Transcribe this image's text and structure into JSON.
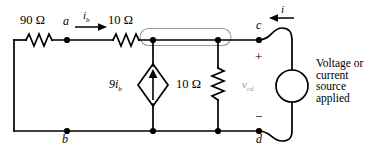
{
  "diagram": {
    "colors": {
      "wire": "#000000",
      "supernode_outline": "#9a9a9a",
      "vcd_label": "#9a9a9a",
      "background": "#ffffff"
    },
    "components": {
      "r90": {
        "label": "90 Ω",
        "orientation": "horizontal"
      },
      "r10_series": {
        "label": "10 Ω",
        "orientation": "horizontal"
      },
      "r10_shunt": {
        "label": "10 Ω",
        "orientation": "vertical"
      },
      "dependent_source": {
        "label_main": "9i",
        "label_sub": "b",
        "type": "current",
        "arrow": "up"
      },
      "applied_source": {
        "type": "generic",
        "shape": "circle"
      }
    },
    "nodes": [
      {
        "id": "a",
        "label": "a"
      },
      {
        "id": "b",
        "label": "b"
      },
      {
        "id": "c",
        "label": "c"
      },
      {
        "id": "d",
        "label": "d"
      }
    ],
    "currents": {
      "ib": {
        "label_main": "i",
        "label_sub": "b",
        "direction": "right"
      },
      "i": {
        "label_main": "i",
        "direction": "left"
      }
    },
    "voltage": {
      "vcd": {
        "label_main": "v",
        "label_sub": "cd"
      },
      "plus": "+",
      "minus": "−"
    },
    "source_caption": {
      "line1": "Voltage or",
      "line2": "current",
      "line3": "source",
      "line4": "applied"
    }
  }
}
